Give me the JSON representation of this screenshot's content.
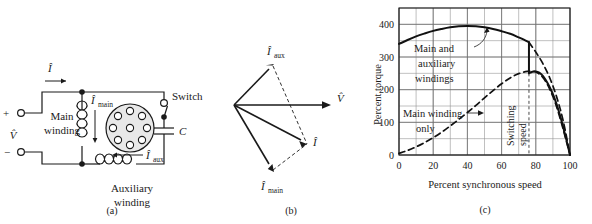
{
  "figure": {
    "panels": [
      {
        "tag": "(a)",
        "title": "capacitor-start motor circuit"
      },
      {
        "tag": "(b)",
        "title": "phasor diagram"
      },
      {
        "tag": "(c)",
        "title": "torque speed characteristic"
      }
    ]
  },
  "circuit": {
    "terminal_plus": "+",
    "terminal_minus": "−",
    "supply_voltage": "V̂",
    "line_current": "Î",
    "main_current_symbol": "Î",
    "main_current_sub": "main",
    "aux_current_symbol": "Î",
    "aux_current_sub": "aux",
    "main_winding_line1": "Main",
    "main_winding_line2": "winding",
    "aux_winding_line1": "Auxiliary",
    "aux_winding_line2": "winding",
    "switch_label": "Switch",
    "capacitor_label": "C",
    "rotor_bar_count": 8,
    "panel_tag": "(a)"
  },
  "phasors": {
    "items": [
      {
        "name": "voltage",
        "symbol": "V̂",
        "sub": "",
        "angle_deg": 0,
        "length": 96
      },
      {
        "name": "aux-current",
        "symbol": "Î",
        "sub": "aux",
        "angle_deg": 42,
        "length": 52
      },
      {
        "name": "total-current",
        "symbol": "Î",
        "sub": "",
        "angle_deg": -28,
        "length": 82
      },
      {
        "name": "main-current",
        "symbol": "Î",
        "sub": "main",
        "angle_deg": -58,
        "length": 74
      }
    ],
    "panel_tag": "(b)"
  },
  "chart_data": {
    "type": "line",
    "title": "",
    "xlabel": "Percent synchronous speed",
    "ylabel": "Percent torque",
    "xlim": [
      0,
      100
    ],
    "ylim": [
      0,
      450
    ],
    "xticks": [
      0,
      20,
      40,
      60,
      80,
      100
    ],
    "yticks": [
      0,
      100,
      200,
      300,
      400
    ],
    "xgrid_minor_step": 10,
    "ygrid_minor_step": 50,
    "grid": true,
    "legend_position": "inline-annotations",
    "annotations": [
      {
        "name": "main-and-auxiliary-windings",
        "text": "Main and auxiliary windings",
        "lines": [
          "Main and",
          "auxiliary",
          "windings"
        ],
        "points_to_x": 52,
        "points_to_y": 392
      },
      {
        "name": "main-winding-only",
        "text": "Main winding only",
        "lines": [
          "Main winding",
          "only"
        ],
        "points_to_x": 46,
        "points_to_y": 128
      },
      {
        "name": "switching-speed",
        "text": "Switching speed",
        "lines": [
          "Switching",
          "speed"
        ],
        "at_x": 76
      }
    ],
    "switching_speed": 76,
    "series": [
      {
        "name": "Main and auxiliary windings",
        "style": "solid",
        "x": [
          0,
          5,
          10,
          15,
          20,
          25,
          30,
          35,
          40,
          45,
          50,
          55,
          60,
          65,
          70,
          73,
          76
        ],
        "values": [
          340,
          352,
          363,
          372,
          380,
          386,
          391,
          394,
          395,
          394,
          391,
          386,
          379,
          371,
          360,
          353,
          345
        ]
      },
      {
        "name": "Main and auxiliary windings (after switching)",
        "style": "solid",
        "x": [
          76,
          78,
          80,
          82,
          84,
          86,
          88,
          90,
          92,
          94,
          96,
          98,
          100
        ],
        "values": [
          250,
          255,
          256,
          252,
          243,
          228,
          209,
          186,
          158,
          124,
          86,
          44,
          0
        ]
      },
      {
        "name": "Switching transition",
        "style": "solid-vertical",
        "x": [
          76,
          76
        ],
        "values": [
          345,
          250
        ]
      },
      {
        "name": "Main winding only",
        "style": "dashed",
        "x": [
          0,
          5,
          10,
          15,
          20,
          25,
          30,
          35,
          40,
          45,
          50,
          55,
          60,
          65,
          70,
          75,
          78,
          80,
          82,
          84,
          86,
          88,
          90,
          92,
          94,
          96,
          98,
          100
        ],
        "values": [
          5,
          14,
          25,
          38,
          53,
          70,
          89,
          109,
          130,
          152,
          175,
          197,
          218,
          236,
          249,
          256,
          256,
          254,
          248,
          238,
          223,
          203,
          179,
          150,
          116,
          79,
          40,
          0
        ]
      },
      {
        "name": "Main and auxiliary windings (upper dashed extension)",
        "style": "dashed",
        "x": [
          76,
          80,
          84,
          88,
          92,
          96,
          100
        ],
        "values": [
          345,
          315,
          281,
          238,
          181,
          105,
          0
        ]
      }
    ],
    "panel_tag": "(c)"
  }
}
